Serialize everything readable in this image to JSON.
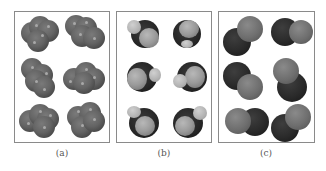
{
  "figure": {
    "panels": [
      {
        "id": "a",
        "label": "(a)",
        "description": "Space-filling models of four-atom gray clusters, 6 orientations"
      },
      {
        "id": "b",
        "label": "(b)",
        "description": "Space-filling models with dark central atom and light outer atoms, 6 orientations"
      },
      {
        "id": "c",
        "label": "(c)",
        "description": "Space-filling models of diatomic molecules (dark + medium gray atom), 6 orientations"
      }
    ]
  },
  "colors": {
    "frame": "#8a8a8a",
    "label_text": "#555555",
    "atom_gray": "#646464",
    "atom_dark": "#262626",
    "atom_light": "#9a9a9a"
  }
}
